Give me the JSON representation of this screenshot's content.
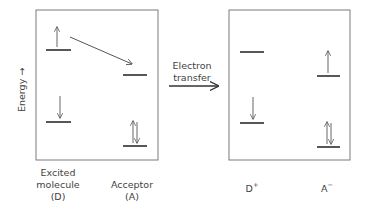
{
  "axis": {
    "label": "Energy",
    "arrow": "→"
  },
  "transfer": {
    "line1": "Electron",
    "line2": "transfer"
  },
  "panels": [
    {
      "name": "before",
      "box": {
        "x": 36,
        "y": 10,
        "w": 122,
        "h": 150
      },
      "columns": [
        {
          "label_lines": [
            "Excited",
            "molecule",
            "(D)"
          ],
          "levels": [
            {
              "y": 50,
              "x1": 46,
              "x2": 71,
              "electrons": [
                "up"
              ]
            },
            {
              "y": 122,
              "x1": 46,
              "x2": 71,
              "electrons": [
                "down"
              ]
            }
          ]
        },
        {
          "label_lines": [
            "Acceptor",
            "(A)"
          ],
          "levels": [
            {
              "y": 75,
              "x1": 123,
              "x2": 147,
              "electrons": []
            },
            {
              "y": 146,
              "x1": 123,
              "x2": 147,
              "electrons": [
                "up",
                "down"
              ]
            }
          ]
        }
      ],
      "transfer_arrow": {
        "x1": 70,
        "y1": 37,
        "x2": 132,
        "y2": 64
      }
    },
    {
      "name": "after",
      "box": {
        "x": 229,
        "y": 10,
        "w": 121,
        "h": 150
      },
      "columns": [
        {
          "label": "D",
          "charge": "+",
          "levels": [
            {
              "y": 52,
              "x1": 240,
              "x2": 264,
              "electrons": []
            },
            {
              "y": 123,
              "x1": 240,
              "x2": 264,
              "electrons": [
                "down"
              ]
            }
          ]
        },
        {
          "label": "A",
          "charge": "−",
          "levels": [
            {
              "y": 76,
              "x1": 317,
              "x2": 340,
              "electrons": [
                "up"
              ]
            },
            {
              "y": 147,
              "x1": 317,
              "x2": 340,
              "electrons": [
                "up",
                "down"
              ]
            }
          ]
        }
      ]
    }
  ],
  "colors": {
    "box": "#7a7a7a",
    "level": "#2e2e2e",
    "arrow": "#555555",
    "text": "#3f3f3f"
  }
}
